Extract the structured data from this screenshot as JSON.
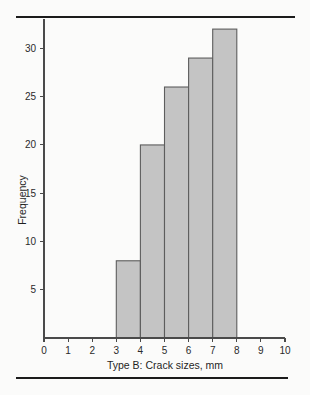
{
  "figure": {
    "background_color": "#fbfbfa",
    "rule_color": "#1b1b1b",
    "top_rule_name": "top-divider",
    "bottom_rule_name": "bottom-divider"
  },
  "chart_data": {
    "type": "bar",
    "title": "",
    "subtitle": "",
    "xlabel": "Type B: Crack sizes, mm",
    "ylabel": "Frequency",
    "categories": [
      "3-4",
      "4-5",
      "5-6",
      "6-7",
      "7-8"
    ],
    "bin_edges": [
      3,
      4,
      5,
      6,
      7,
      8
    ],
    "values": [
      8,
      20,
      26,
      29,
      32
    ],
    "xlim": [
      0,
      10
    ],
    "ylim": [
      0,
      33
    ],
    "xticks": [
      0,
      1,
      2,
      3,
      4,
      5,
      6,
      7,
      8,
      9,
      10
    ],
    "xtick_labels": [
      "0",
      "1",
      "2",
      "3",
      "4",
      "5",
      "6",
      "7",
      "8",
      "9",
      "10"
    ],
    "yticks": [
      5,
      10,
      15,
      20,
      25,
      30
    ],
    "ytick_labels": [
      "5",
      "10",
      "15",
      "20",
      "25",
      "30"
    ],
    "grid": false,
    "legend": false,
    "legend_position": "none",
    "bar_fill_color": "#c4c4c4",
    "bar_edge_color": "#5d5d5d",
    "axis_color": "#4a4a4a",
    "text_color": "#2a2a2a"
  }
}
